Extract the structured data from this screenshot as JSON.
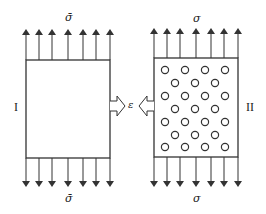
{
  "diagram": {
    "left_panel": {
      "id_label": "I",
      "top_stress_label": "σ̄",
      "bottom_stress_label": "σ̄",
      "description": "plain block under uniform tensile stress"
    },
    "right_panel": {
      "id_label": "II",
      "top_stress_label": "σ",
      "bottom_stress_label": "σ",
      "description": "block with distributed circular voids under tensile stress",
      "void_rows": [
        4,
        3,
        4,
        3,
        4,
        3,
        4
      ]
    },
    "center_label": "ε",
    "arrow_count_per_edge": 7,
    "colors": {
      "stroke": "#333333",
      "background": "#ffffff"
    }
  }
}
